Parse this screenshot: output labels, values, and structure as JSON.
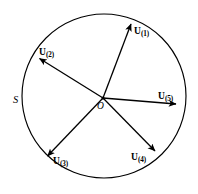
{
  "figure": {
    "type": "vector-diagram",
    "background_color": "#ffffff",
    "stroke_color": "#000000",
    "region": {
      "name": "S",
      "label": "S",
      "shape": "circle",
      "center": {
        "x": 104,
        "y": 96
      },
      "radius": 82,
      "label_position": {
        "x": 13,
        "y": 95
      }
    },
    "origin": {
      "label": "O",
      "x": 103,
      "y": 98,
      "label_position": {
        "x": 97,
        "y": 102
      }
    },
    "vectors": [
      {
        "id": "u1",
        "label": "U",
        "subscript": "(1)",
        "tip": {
          "x": 131,
          "y": 22
        },
        "label_position": {
          "x": 134,
          "y": 27
        }
      },
      {
        "id": "u2",
        "label": "U",
        "subscript": "(2)",
        "tip": {
          "x": 38,
          "y": 57
        },
        "label_position": {
          "x": 39,
          "y": 48
        }
      },
      {
        "id": "u3",
        "label": "U",
        "subscript": "(3)",
        "tip": {
          "x": 46,
          "y": 158
        },
        "label_position": {
          "x": 53,
          "y": 157
        }
      },
      {
        "id": "u4",
        "label": "U",
        "subscript": "(4)",
        "tip": {
          "x": 157,
          "y": 153
        },
        "label_position": {
          "x": 131,
          "y": 153
        }
      },
      {
        "id": "u5",
        "label": "U",
        "subscript": "(5)",
        "tip": {
          "x": 178,
          "y": 104
        },
        "label_position": {
          "x": 158,
          "y": 92
        }
      }
    ]
  }
}
